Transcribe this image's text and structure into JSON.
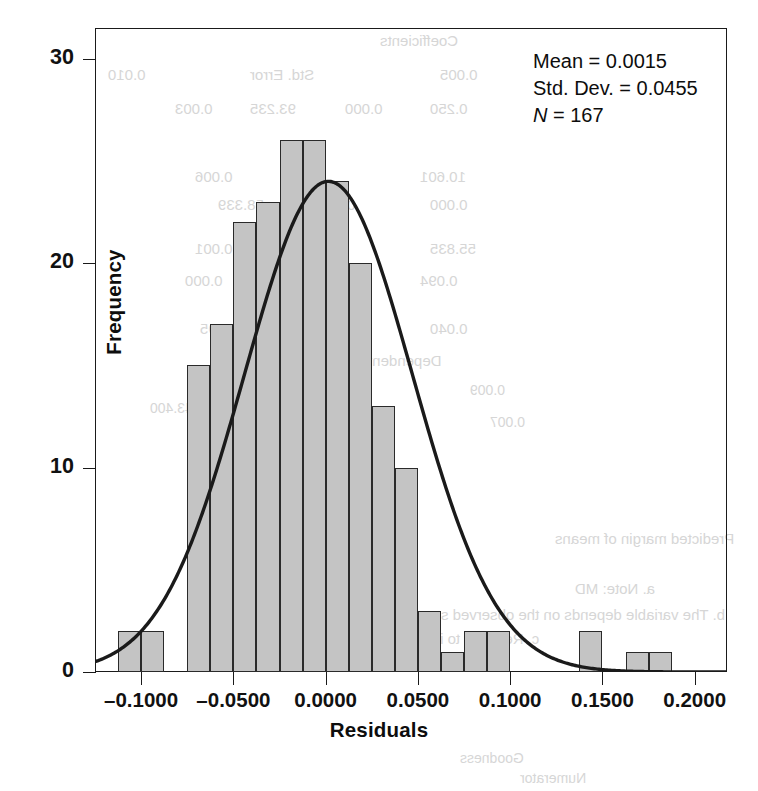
{
  "chart_data": {
    "type": "bar",
    "title": "",
    "subtitle": "",
    "xlabel": "Residuals",
    "ylabel": "Frequency",
    "xlim": [
      -0.125,
      0.2175
    ],
    "ylim": [
      0,
      31.5
    ],
    "grid": false,
    "legend_position": "none",
    "bin_width": 0.0125,
    "x_ticks": [
      "–0.1000",
      "–0.0500",
      "0.0000",
      "0.0500",
      "0.1000",
      "0.1500",
      "0.2000"
    ],
    "x_tick_values": [
      -0.1,
      -0.05,
      0.0,
      0.05,
      0.1,
      0.15,
      0.2
    ],
    "y_ticks": [
      "0",
      "10",
      "20",
      "30"
    ],
    "y_tick_values": [
      0,
      10,
      20,
      30
    ],
    "bin_left_edges": [
      -0.1125,
      -0.1,
      -0.0875,
      -0.075,
      -0.0625,
      -0.05,
      -0.0375,
      -0.025,
      -0.0125,
      0.0,
      0.0125,
      0.025,
      0.0375,
      0.05,
      0.0625,
      0.075,
      0.0875,
      0.1,
      0.1125,
      0.125,
      0.1375,
      0.15,
      0.1625,
      0.175
    ],
    "bin_centers": [
      -0.10625,
      -0.09375,
      -0.08125,
      -0.06875,
      -0.05625,
      -0.04375,
      -0.03125,
      -0.01875,
      -0.00625,
      0.00625,
      0.01875,
      0.03125,
      0.04375,
      0.05625,
      0.06875,
      0.08125,
      0.09375,
      0.10625,
      0.11875,
      0.13125,
      0.14375,
      0.15625,
      0.16875,
      0.18125
    ],
    "values": [
      2,
      2,
      0,
      15,
      17,
      22,
      23,
      26,
      26,
      24,
      20,
      13,
      10,
      3,
      1,
      2,
      2,
      0,
      0,
      0,
      2,
      0,
      1,
      1
    ],
    "curve": {
      "type": "normal",
      "mean": 0.0015,
      "std_dev": 0.0455,
      "n": 167,
      "peak_value": 24.0,
      "color": "#1a1a1a"
    },
    "annotations": [
      "Mean = 0.0015",
      "Std. Dev. = 0.0455",
      "N = 167"
    ]
  },
  "stats": {
    "mean_label": "Mean = 0.0015",
    "stddev_label": "Std. Dev. = 0.0455",
    "n_symbol": "N",
    "n_label": " = 167"
  },
  "axes": {
    "x_title": "Residuals",
    "y_title": "Frequency"
  },
  "bleed_text": [
    "Coefficients",
    "Std. Error",
    "0.010",
    "0.005",
    "93.235",
    "0.000",
    "0.250",
    "0.003",
    "0.006",
    "10.601",
    "0.002",
    "58.339",
    "0.000",
    "0.001",
    "0.045",
    "55.835",
    "0.000",
    "0.021",
    "0.094",
    "51.95",
    "0.040",
    "Dependent Variable",
    "0.009",
    "43.400",
    "0.007",
    "Predicted margin of means",
    "a. Note: MD",
    "b. The variable depends on the observed sample characteristics",
    "c. Relevant to instrument of the outcome",
    "Model Fit",
    "Goodness",
    "Numerator",
    "Denominator",
    "Residual",
    "df match",
    "a. The model compares the distribution of the values",
    "b. The model is adjusted to the marginal fit"
  ]
}
